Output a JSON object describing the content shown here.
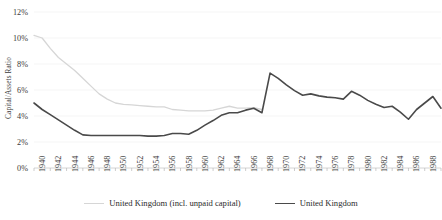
{
  "chart_data": {
    "type": "line",
    "title": "",
    "xlabel": "",
    "ylabel": "Capital/Assets Ratio",
    "xlim": [
      1940,
      1990
    ],
    "ylim": [
      0,
      12
    ],
    "y_tick_labels": [
      "0%",
      "2%",
      "4%",
      "6%",
      "8%",
      "10%",
      "12%"
    ],
    "y_ticks": [
      0,
      2,
      4,
      6,
      8,
      10,
      12
    ],
    "x_tick_labels": [
      "1940",
      "1942",
      "1944",
      "1946",
      "1948",
      "1950",
      "1952",
      "1954",
      "1956",
      "1958",
      "1960",
      "1962",
      "1964",
      "1966",
      "1968",
      "1970",
      "1972",
      "1974",
      "1976",
      "1978",
      "1980",
      "1982",
      "1984",
      "1986",
      "1988",
      "1990"
    ],
    "x_ticks": [
      1940,
      1942,
      1944,
      1946,
      1948,
      1950,
      1952,
      1954,
      1956,
      1958,
      1960,
      1962,
      1964,
      1966,
      1968,
      1970,
      1972,
      1974,
      1976,
      1978,
      1980,
      1982,
      1984,
      1986,
      1988,
      1990
    ],
    "grid": "horizontal",
    "legend_position": "bottom",
    "series": [
      {
        "name": "United Kingdom (incl. unpaid capital)",
        "color": "#d6d6d6",
        "width": 1.3,
        "x": [
          1940,
          1941,
          1942,
          1943,
          1944,
          1945,
          1946,
          1947,
          1948,
          1949,
          1950,
          1951,
          1952,
          1953,
          1954,
          1955,
          1956,
          1957,
          1958,
          1959,
          1960,
          1961,
          1962,
          1963,
          1964,
          1965,
          1966,
          1967,
          1968
        ],
        "values": [
          10.2,
          10.0,
          9.2,
          8.5,
          8.0,
          7.5,
          6.9,
          6.3,
          5.7,
          5.3,
          5.0,
          4.9,
          4.85,
          4.8,
          4.75,
          4.7,
          4.7,
          4.5,
          4.45,
          4.4,
          4.4,
          4.4,
          4.45,
          4.6,
          4.75,
          4.6,
          4.6,
          4.65,
          4.5
        ]
      },
      {
        "name": "United Kingdom",
        "color": "#4a4a4a",
        "width": 1.6,
        "x": [
          1940,
          1941,
          1942,
          1943,
          1944,
          1945,
          1946,
          1947,
          1948,
          1949,
          1950,
          1951,
          1952,
          1953,
          1954,
          1955,
          1956,
          1957,
          1958,
          1959,
          1960,
          1961,
          1962,
          1963,
          1964,
          1965,
          1966,
          1967,
          1968,
          1969,
          1970,
          1971,
          1972,
          1973,
          1974,
          1975,
          1976,
          1977,
          1978,
          1979,
          1980,
          1981,
          1982,
          1983,
          1984,
          1985,
          1986,
          1987,
          1988,
          1989,
          1990
        ],
        "values": [
          5.0,
          4.5,
          4.1,
          3.7,
          3.3,
          2.9,
          2.55,
          2.5,
          2.5,
          2.5,
          2.5,
          2.5,
          2.5,
          2.5,
          2.45,
          2.45,
          2.5,
          2.65,
          2.65,
          2.6,
          2.9,
          3.3,
          3.65,
          4.05,
          4.25,
          4.25,
          4.45,
          4.6,
          4.25,
          7.3,
          6.9,
          6.4,
          5.95,
          5.6,
          5.7,
          5.55,
          5.45,
          5.4,
          5.3,
          5.9,
          5.6,
          5.2,
          4.9,
          4.65,
          4.75,
          4.3,
          3.75,
          4.5,
          5.0,
          5.5,
          4.6
        ]
      }
    ]
  }
}
